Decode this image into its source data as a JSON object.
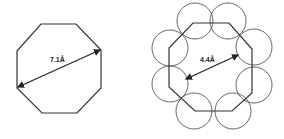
{
  "diagrams": [
    {
      "name": "octagon-single",
      "label": "7.1Å",
      "polygon": "41,24 76,24 101,50 101,88 77,113 42,113 17,88 17,51",
      "arrow": {
        "x1": 18,
        "y1": 87,
        "x2": 100,
        "y2": 50
      },
      "label_pos": {
        "x": 50,
        "y": 62
      }
    },
    {
      "name": "octagon-with-circles",
      "label": "4.4Å",
      "polygon": "193,23 229,23 252,49 252,93 232,111 195,111 169,87 169,48",
      "arrow": {
        "x1": 186,
        "y1": 79,
        "x2": 238,
        "y2": 55
      },
      "label_pos": {
        "x": 200,
        "y": 62
      },
      "circles": [
        {
          "cx": 195,
          "cy": 21
        },
        {
          "cx": 228,
          "cy": 21
        },
        {
          "cx": 254,
          "cy": 47
        },
        {
          "cx": 254,
          "cy": 85
        },
        {
          "cx": 233,
          "cy": 111
        },
        {
          "cx": 194,
          "cy": 111
        },
        {
          "cx": 170,
          "cy": 84
        },
        {
          "cx": 170,
          "cy": 48
        }
      ],
      "circle_radius": 18
    }
  ],
  "colors": {
    "stroke": "#333333",
    "circle": "#555555",
    "background": "#ffffff"
  }
}
